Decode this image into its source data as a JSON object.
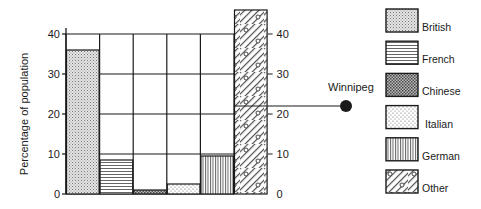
{
  "chart_data": {
    "type": "bar",
    "title": "",
    "xlabel": "",
    "ylabel": "Percentage of population",
    "ylim": [
      0,
      40
    ],
    "yticks": [
      0,
      10,
      20,
      30,
      40
    ],
    "right_yticks": [
      0,
      10,
      20,
      30,
      40
    ],
    "grid": true,
    "categories": [
      "British",
      "French",
      "Chinese",
      "Italian",
      "German",
      "Other"
    ],
    "values": [
      36,
      8.5,
      1,
      2.5,
      9.5,
      46
    ],
    "annotations": [
      {
        "label": "Winnipeg",
        "value": 22,
        "marker": "filled-circle"
      }
    ],
    "legend": {
      "position": "right",
      "entries": [
        {
          "label": "British",
          "pattern": "fine-dots"
        },
        {
          "label": "French",
          "pattern": "horizontal-lines"
        },
        {
          "label": "Chinese",
          "pattern": "dense-crosshatch"
        },
        {
          "label": "Italian",
          "pattern": "sparse-dots"
        },
        {
          "label": "German",
          "pattern": "vertical-lines"
        },
        {
          "label": "Other",
          "pattern": "diagonal-lines-with-circles"
        }
      ]
    }
  },
  "colors": {
    "ink": "#1a1a1a",
    "background": "#ffffff"
  }
}
